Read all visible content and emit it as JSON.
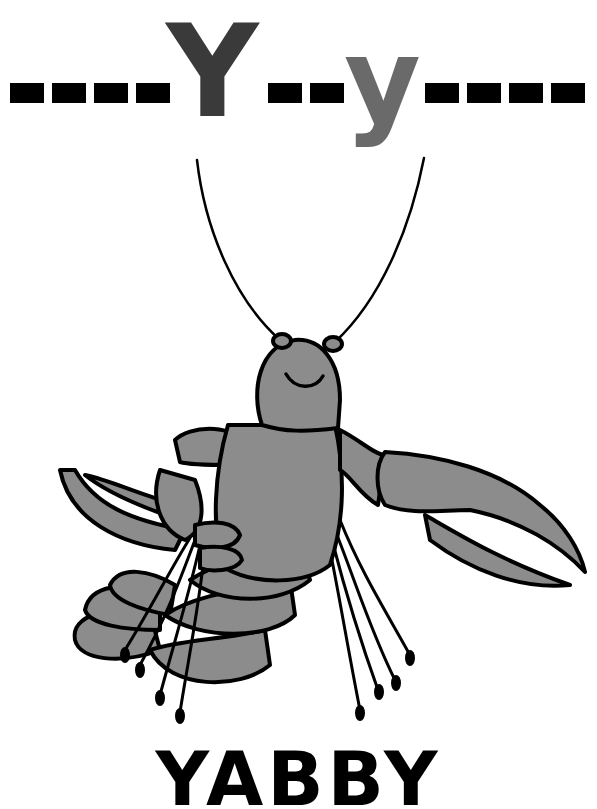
{
  "card": {
    "uppercase": "Y",
    "lowercase": "y",
    "word": "YABBY",
    "illustration": "yabby-crayfish",
    "colors": {
      "uppercase": "#3a3a3a",
      "lowercase": "#6a6a6a",
      "body_fill": "#8c8c8c",
      "outline": "#000000",
      "dashes": "#000000"
    }
  }
}
